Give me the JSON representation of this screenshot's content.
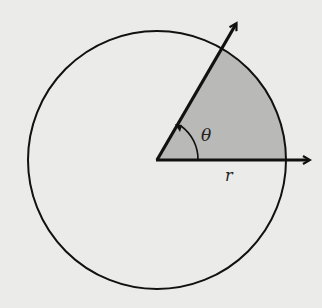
{
  "diagram": {
    "colors": {
      "background": "#ebebe9",
      "sector_fill": "#b9b9b7",
      "stroke": "#111111"
    },
    "circle": {
      "cx": 157,
      "cy": 160,
      "r": 129
    },
    "sector": {
      "angle_degrees": 60,
      "start_degrees": 0
    },
    "rays": [
      {
        "name": "horizontal-ray",
        "x2": 310,
        "y2": 160
      },
      {
        "name": "angled-ray",
        "x2": 237,
        "y2": 22
      }
    ],
    "labels": {
      "angle": "θ",
      "radius": "r"
    }
  }
}
